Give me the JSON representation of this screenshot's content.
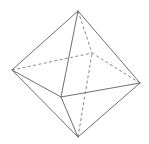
{
  "figure": {
    "name": "octahedron",
    "width": 149,
    "height": 144,
    "background_color": "#ffffff",
    "line_color": "#6f6f6f",
    "hidden_line_color": "#8a8a8a",
    "line_width": 1,
    "hidden_line_width": 1,
    "hidden_dash_pattern": "3,2.4",
    "vertices": {
      "top": {
        "label": "top",
        "x": 78,
        "y": 11
      },
      "bottom": {
        "label": "bottom",
        "x": 78,
        "y": 137
      },
      "left": {
        "label": "left",
        "x": 12,
        "y": 70
      },
      "right": {
        "label": "right",
        "x": 140,
        "y": 83
      },
      "front": {
        "label": "front",
        "x": 61,
        "y": 97
      },
      "back": {
        "label": "back",
        "x": 92,
        "y": 53
      }
    },
    "visible_edges": [
      {
        "name": "top-left",
        "from": "top",
        "to": "left"
      },
      {
        "name": "top-right",
        "from": "top",
        "to": "right"
      },
      {
        "name": "top-front",
        "from": "top",
        "to": "front"
      },
      {
        "name": "bottom-left",
        "from": "bottom",
        "to": "left"
      },
      {
        "name": "bottom-right",
        "from": "bottom",
        "to": "right"
      },
      {
        "name": "bottom-front",
        "from": "bottom",
        "to": "front"
      },
      {
        "name": "left-front",
        "from": "left",
        "to": "front"
      },
      {
        "name": "right-front",
        "from": "right",
        "to": "front"
      }
    ],
    "hidden_edges": [
      {
        "name": "top-back",
        "from": "top",
        "to": "back"
      },
      {
        "name": "bottom-back",
        "from": "bottom",
        "to": "back"
      },
      {
        "name": "left-back",
        "from": "left",
        "to": "back"
      },
      {
        "name": "right-back",
        "from": "right",
        "to": "back"
      }
    ]
  }
}
